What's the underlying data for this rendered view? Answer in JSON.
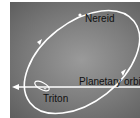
{
  "diagram": {
    "labels": {
      "nereid": "Nereid",
      "planetary_orbit": "Planetary orbit",
      "triton": "Triton"
    },
    "colors": {
      "orbit_line": "#ffffff",
      "background_center": "#9a9a9a",
      "background_edge": "#5e5e5e",
      "label_text": "#111111"
    }
  }
}
